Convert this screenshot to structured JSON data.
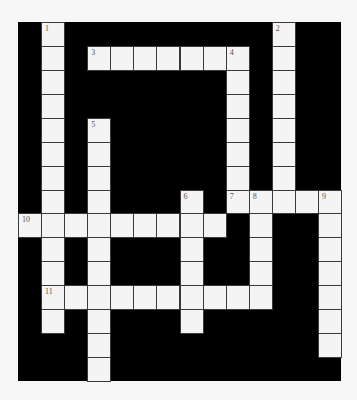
{
  "puzzle": {
    "cols": 14,
    "rows": 15,
    "colors": {
      "block": "#000000",
      "cell": "#f4f4f4",
      "page": "#f7f7f7",
      "number": "#555555"
    },
    "entries": [
      {
        "number": "1",
        "direction": "down",
        "col": 1,
        "row": 0,
        "length": 13
      },
      {
        "number": "2",
        "direction": "down",
        "col": 11,
        "row": 0,
        "length": 8
      },
      {
        "number": "3",
        "direction": "across",
        "col": 3,
        "row": 1,
        "length": 7
      },
      {
        "number": "4",
        "direction": "down",
        "col": 9,
        "row": 1,
        "length": 7
      },
      {
        "number": "5",
        "direction": "down",
        "col": 3,
        "row": 4,
        "length": 11
      },
      {
        "number": "6",
        "direction": "down",
        "col": 7,
        "row": 7,
        "length": 6
      },
      {
        "number": "7",
        "direction": "across",
        "col": 9,
        "row": 7,
        "length": 5
      },
      {
        "number": "8",
        "direction": "down",
        "col": 10,
        "row": 7,
        "length": 5
      },
      {
        "number": "9",
        "direction": "down",
        "col": 13,
        "row": 7,
        "length": 7
      },
      {
        "number": "10",
        "direction": "across",
        "col": 0,
        "row": 8,
        "length": 9
      },
      {
        "number": "11",
        "direction": "across",
        "col": 1,
        "row": 11,
        "length": 10
      }
    ]
  }
}
